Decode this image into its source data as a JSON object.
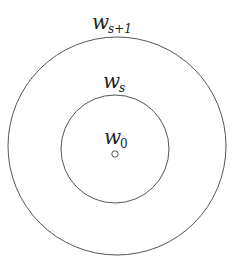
{
  "diagram": {
    "type": "concentric-circles",
    "stroke_color": "#555555",
    "labels": {
      "outer": {
        "base": "w",
        "sub": "s+1"
      },
      "middle": {
        "base": "w",
        "sub": "s"
      },
      "center": {
        "base": "w",
        "sub": "0"
      }
    },
    "circles": [
      {
        "name": "outer",
        "cx": 117,
        "cy": 146,
        "r": 109
      },
      {
        "name": "middle",
        "cx": 115,
        "cy": 149,
        "r": 54
      },
      {
        "name": "center-point",
        "cx": 115,
        "cy": 154,
        "r": 3
      }
    ]
  }
}
